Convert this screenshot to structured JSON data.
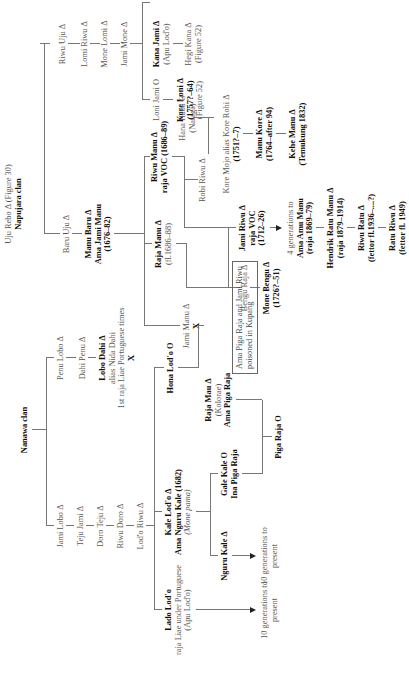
{
  "figure": {
    "orientation": "rotated 90 degrees counter-clockwise",
    "nanawa_clan": {
      "label": "Nanawa clan",
      "line_a": [
        {
          "name": "Jami Lobo Δ"
        },
        {
          "name": "Teju Jami Δ"
        },
        {
          "name": "Doro Teju Δ"
        },
        {
          "name": "Riwu Doro Δ"
        },
        {
          "name": "Lod'o Riwu Δ"
        }
      ],
      "line_b": [
        {
          "name": "Penu Lobo Δ"
        },
        {
          "name": "Dahi Penu Δ"
        },
        {
          "name": "Lobo Dahi Δ",
          "alias": "alias Nida Dahi",
          "note": "1st raja Liae Portuguese times",
          "mark": "X"
        }
      ],
      "lado_lodo": {
        "name": "Lado Lod'o",
        "title": "raja Liae under Portuguese",
        "note": "(Apu Lod'o)"
      },
      "lado_descendants": "10 generations to present",
      "kale_lodo": {
        "name": "Kale Lod'o Δ",
        "alias": "Ama Nguru Kale (1682)",
        "note": "(Mone pama)"
      },
      "hona_lodo": {
        "name": "Hona Lod'o O"
      },
      "nguru_kale": {
        "name": "Nguru Kale Δ"
      },
      "nguru_descendants": "10 generations to present",
      "gale_kale": {
        "name": "Gale Kale O",
        "alias": "Ina Piga Raja"
      },
      "raja_mau": {
        "name": "Raja Mau Δ",
        "note": "(Kolorae)",
        "alias": "Ama Piga Raja"
      },
      "piga_raja": {
        "name": "Piga Raja O"
      }
    },
    "napujara_clan": {
      "root": {
        "name": "Uju Rebo Δ (Figure 30)",
        "label": "Napujara clan"
      },
      "riwu_line": [
        {
          "name": "Riwu Uju Δ"
        },
        {
          "name": "Lomi Riwu Δ"
        },
        {
          "name": "Mone Lomi Δ"
        },
        {
          "name": "Jami Mone Δ"
        }
      ],
      "kana_jami": {
        "name": "Kana Jami Δ",
        "note": "(Apu Lod'o)"
      },
      "hegi_kana": {
        "name": "Hegi Kana Δ",
        "note": "(Figure 52)"
      },
      "loni_jami": {
        "name": "Loni Jami O"
      },
      "kore_loni": {
        "name": "Kore Loni Δ",
        "dates": "(1757?–64)",
        "note": "(Figure 52)"
      },
      "baru_uju": {
        "name": "Baru Uju Δ"
      },
      "manu_baru": {
        "name": "Manu Baru Δ",
        "alias": "Ama Jami Manu",
        "dates": "(1676–82)"
      },
      "riwu_manu": {
        "name": "Riwu Manu Δ",
        "title": "raja VOC (1686–89)"
      },
      "raja_manu": {
        "name": "Raja Manu Δ",
        "dates": "(fl.1686–88)"
      },
      "jami_manu": {
        "name": "Jami Manu Δ",
        "mark": "X"
      },
      "hana_haba": {
        "name": "Hana Haba O",
        "note": "(Nataga)"
      },
      "robi_riwu": {
        "name": "Robi Riwu Δ"
      },
      "kore_mojo": {
        "name": "Kore Mojo alias Kore Rohi Δ",
        "dates": "(1751?–7)"
      },
      "manu_kore": {
        "name": "Manu Kore Δ",
        "dates": "(1764–after 94)"
      },
      "kehe_manu": {
        "name": "Kehe Manu Δ",
        "note": "(Temukung 1832)"
      },
      "jami_riwu": {
        "name": "Jami Riwu Δ",
        "title": "raja VOC",
        "dates": "(1712–26)"
      },
      "four_generations": {
        "label": "4 generations to",
        "name": "Ama Amu Manu",
        "dates": "(raja 1869–79)"
      },
      "hendrik": {
        "name": "Hendrik Ratu Manu Δ",
        "dates": "(raja 1879–1914)"
      },
      "riwu_ratu": {
        "name": "Riwu Ratu Δ",
        "dates": "(fettor fl.1936–....?)"
      },
      "ratu_riwu": {
        "name": "Ratu Riwu Δ",
        "dates": "(fettor fl. 1949)"
      },
      "bengu_raja": {
        "name": "Bengu Raja Δ"
      },
      "mone_bengu": {
        "name": "Mone Bengu Δ",
        "dates": "(1726?–51)"
      },
      "note_box": {
        "line1": "Ama Piga Raja and Jami Riwu",
        "line2": "poisoned in Kupang"
      }
    }
  }
}
